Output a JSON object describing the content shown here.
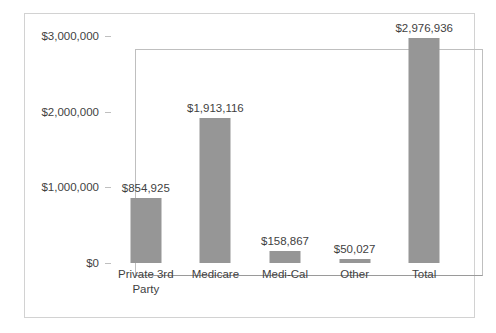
{
  "chart_data": {
    "type": "bar",
    "title": "",
    "subtitle": "",
    "xlabel": "",
    "ylabel": "",
    "categories": [
      "Private 3rd Party",
      "Medicare",
      "Medi-Cal",
      "Other",
      "Total"
    ],
    "values": [
      854925,
      1913116,
      158867,
      50027,
      2976936
    ],
    "value_labels": [
      "$854,925",
      "$1,913,116",
      "$158,867",
      "$50,027",
      "$2,976,936"
    ],
    "series": [
      {
        "name": "Amount",
        "values": [
          854925,
          1913116,
          158867,
          50027,
          2976936
        ]
      }
    ],
    "ylim": [
      0,
      3000000
    ],
    "ytick_values": [
      0,
      1000000,
      2000000,
      3000000
    ],
    "ytick_labels": [
      "$0",
      "$1,000,000",
      "$2,000,000",
      "$3,000,000"
    ],
    "grid": false,
    "legend": false,
    "legend_position": "none",
    "bar_color": "#969696",
    "plot_border_color": "#bfbfbf",
    "axis_color": "#9a9a9a",
    "frame_color": "#d2d2d2",
    "background_color": "#ffffff",
    "text_color": "#3f3f3f",
    "data_labels_shown": true
  }
}
